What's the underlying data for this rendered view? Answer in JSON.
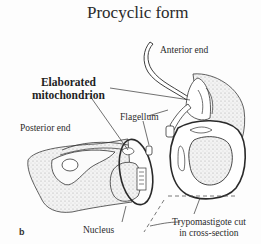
{
  "figure": {
    "title": "Procyclic form",
    "panel_letter": "b",
    "labels": {
      "anterior_end": "Anterior end",
      "mitochondrion_line1": "Elaborated",
      "mitochondrion_line2": "mitochondrion",
      "flagellum": "Flagellum",
      "posterior_end": "Posterior end",
      "nucleus": "Nucleus",
      "cross_section_line1": "Trypomastigote cut",
      "cross_section_line2": "in cross-section"
    }
  },
  "colors": {
    "ink": "#2a2a2a",
    "stipple": "#e4e4e4",
    "background": "#fdfdfd"
  }
}
